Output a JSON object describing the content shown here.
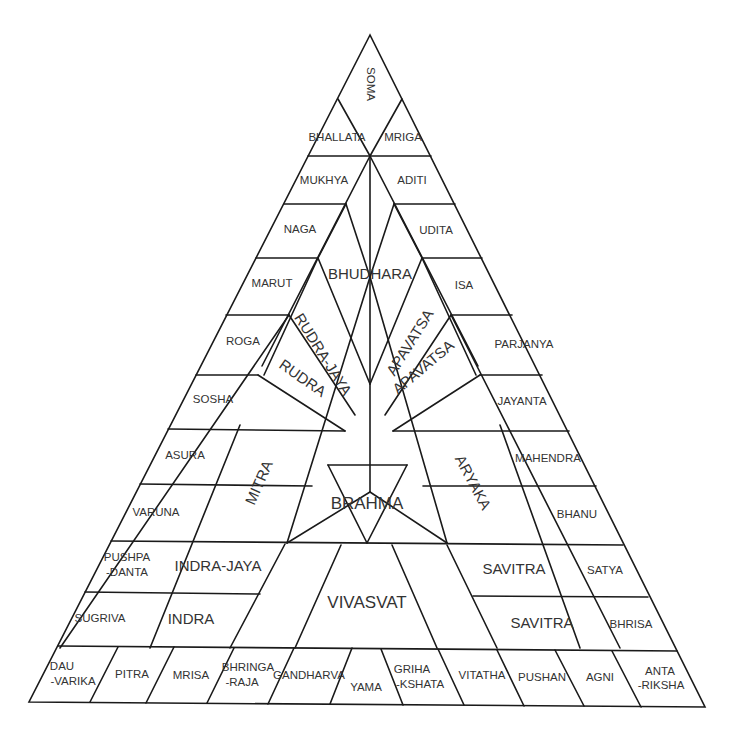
{
  "colors": {
    "line": "#1a1a1a",
    "text": "#333333",
    "background": "#ffffff"
  },
  "labels": {
    "soma": "SOMA",
    "bhallata": "BHALLATA",
    "mriga": "MRIGA",
    "mukhya": "MUKHYA",
    "aditi": "ADITI",
    "naga": "NAGA",
    "udita": "UDITA",
    "bhudhara": "BHUDHARA",
    "marut": "MARUT",
    "isa": "ISA",
    "roga": "ROGA",
    "rudra_jaya": "RUDRA-JAYA",
    "apavatsa_outer": "APAVATSA",
    "apavatsa_inner": "APAVATSA",
    "parjanya": "PARJANYA",
    "rudra": "RUDRA",
    "sosha": "SOSHA",
    "jayanta": "JAYANTA",
    "asura": "ASURA",
    "mahendra": "MAHENDRA",
    "mitra": "MITRA",
    "aryaka": "ARYAKA",
    "varuna": "VARUNA",
    "brahma": "BRAHMA",
    "bhanu": "BHANU",
    "pushpadanta_1": "PUSHPA",
    "pushpadanta_2": "-DANTA",
    "indra_jaya": "INDRA-JAYA",
    "savitra_upper": "SAVITRA",
    "satya": "SATYA",
    "sugriva": "SUGRIVA",
    "indra": "INDRA",
    "vivasvat": "VIVASVAT",
    "savitra_lower": "SAVITRA",
    "bhrisa": "BHRISA",
    "dauvarika_1": "DAU",
    "dauvarika_2": "-VARIKA",
    "pitra": "PITRA",
    "mrisa": "MRISA",
    "bhringaraja_1": "BHRINGA",
    "bhringaraja_2": "-RAJA",
    "gandharva": "GANDHARVA",
    "yama": "YAMA",
    "grihakshata_1": "GRIHA",
    "grihakshata_2": "-KSHATA",
    "vitatha": "VITATHA",
    "pushan": "PUSHAN",
    "agni": "AGNI",
    "antariksha_1": "ANTA",
    "antariksha_2": "-RIKSHA"
  }
}
